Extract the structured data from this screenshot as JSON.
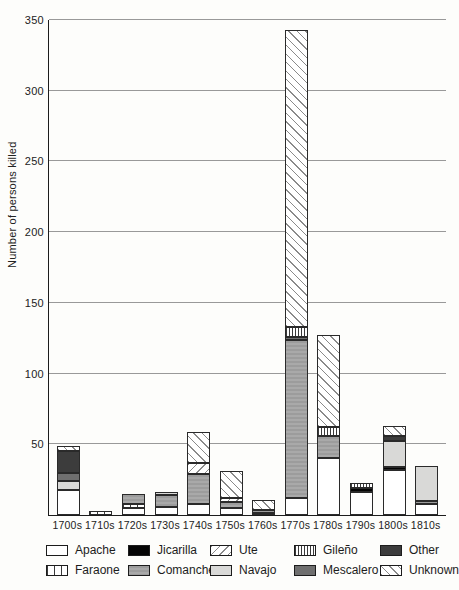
{
  "chart_data": {
    "type": "bar",
    "variant": "stacked-vertical",
    "title": "",
    "xlabel": "",
    "ylabel": "Number of persons killed",
    "ylim": [
      0,
      350
    ],
    "yticks": [
      50,
      100,
      150,
      200,
      250,
      300,
      350
    ],
    "grid": "horizontal",
    "legend_position": "bottom",
    "categories": [
      "1700s",
      "1710s",
      "1720s",
      "1730s",
      "1740s",
      "1750s",
      "1760s",
      "1770s",
      "1780s",
      "1790s",
      "1800s",
      "1810s"
    ],
    "series_keys": [
      "Apache",
      "Faraone",
      "Jicarilla",
      "Comanche",
      "Ute",
      "Navajo",
      "Gileño",
      "Mescalero",
      "Other",
      "Unknown"
    ],
    "bars": [
      {
        "decade": "1700s",
        "total": 49,
        "segments": [
          [
            "Apache",
            18
          ],
          [
            "Navajo",
            6
          ],
          [
            "Mescalero",
            6
          ],
          [
            "Other",
            15
          ],
          [
            "Unknown",
            4
          ]
        ]
      },
      {
        "decade": "1710s",
        "total": 3,
        "segments": [
          [
            "Faraone",
            3
          ]
        ]
      },
      {
        "decade": "1720s",
        "total": 15,
        "segments": [
          [
            "Apache",
            5
          ],
          [
            "Faraone",
            3
          ],
          [
            "Comanche",
            7
          ]
        ]
      },
      {
        "decade": "1730s",
        "total": 16,
        "segments": [
          [
            "Apache",
            6
          ],
          [
            "Comanche",
            8
          ],
          [
            "Navajo",
            2
          ]
        ]
      },
      {
        "decade": "1740s",
        "total": 59,
        "segments": [
          [
            "Apache",
            8
          ],
          [
            "Comanche",
            21
          ],
          [
            "Ute",
            8
          ],
          [
            "Unknown",
            22
          ]
        ]
      },
      {
        "decade": "1750s",
        "total": 31,
        "segments": [
          [
            "Apache",
            5
          ],
          [
            "Comanche",
            4
          ],
          [
            "Ute",
            3
          ],
          [
            "Unknown",
            19
          ]
        ]
      },
      {
        "decade": "1760s",
        "total": 10,
        "segments": [
          [
            "Apache",
            1
          ],
          [
            "Comanche",
            2
          ],
          [
            "Unknown",
            7
          ]
        ]
      },
      {
        "decade": "1770s",
        "total": 343,
        "segments": [
          [
            "Apache",
            12
          ],
          [
            "Comanche",
            112
          ],
          [
            "Mescalero",
            2
          ],
          [
            "Gileño",
            7
          ],
          [
            "Unknown",
            210
          ]
        ]
      },
      {
        "decade": "1780s",
        "total": 127,
        "segments": [
          [
            "Apache",
            40
          ],
          [
            "Comanche",
            16
          ],
          [
            "Gileño",
            6
          ],
          [
            "Unknown",
            65
          ]
        ]
      },
      {
        "decade": "1790s",
        "total": 23,
        "segments": [
          [
            "Apache",
            16
          ],
          [
            "Jicarilla",
            3
          ],
          [
            "Gileño",
            4
          ]
        ]
      },
      {
        "decade": "1800s",
        "total": 63,
        "segments": [
          [
            "Apache",
            32
          ],
          [
            "Jicarilla",
            2
          ],
          [
            "Navajo",
            18
          ],
          [
            "Other",
            4
          ],
          [
            "Unknown",
            7
          ]
        ]
      },
      {
        "decade": "1810s",
        "total": 35,
        "segments": [
          [
            "Apache",
            8
          ],
          [
            "Comanche",
            2
          ],
          [
            "Navajo",
            25
          ]
        ]
      }
    ],
    "legend": {
      "rows": [
        [
          "Apache",
          "Jicarilla",
          "Ute",
          "Gileño",
          "Other"
        ],
        [
          "Faraone",
          "Comanche",
          "Navajo",
          "Mescalero",
          "Unknown"
        ]
      ]
    },
    "patterns": {
      "Apache": {
        "fill": "#ffffff",
        "pattern": "solid"
      },
      "Faraone": {
        "fill": "#ffffff",
        "pattern": "vertical-lines-sparse"
      },
      "Jicarilla": {
        "fill": "#050505",
        "pattern": "solid"
      },
      "Comanche": {
        "fill": "#a2a2a2",
        "pattern": "solid-gray"
      },
      "Ute": {
        "fill": "#ffffff",
        "pattern": "diagonal-forward-slash"
      },
      "Navajo": {
        "fill": "#d9d9d7",
        "pattern": "solid"
      },
      "Gileño": {
        "fill": "#ffffff",
        "pattern": "vertical-lines-dense"
      },
      "Mescalero": {
        "fill": "#6f6f6f",
        "pattern": "solid"
      },
      "Other": {
        "fill": "#3c3c3c",
        "pattern": "solid"
      },
      "Unknown": {
        "fill": "#ffffff",
        "pattern": "diagonal-back-slash"
      }
    },
    "axis_color": "#1c1c1c",
    "gridline_color": "#999999"
  }
}
